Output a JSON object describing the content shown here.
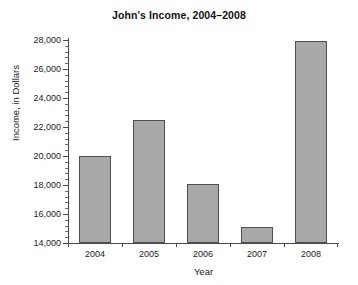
{
  "chart_data": {
    "type": "bar",
    "title": "John's Income, 2004–2008",
    "xlabel": "Year",
    "ylabel": "Income, in Dollars",
    "categories": [
      "2004",
      "2005",
      "2006",
      "2007",
      "2008"
    ],
    "values": [
      20000,
      22500,
      18100,
      15100,
      27950
    ],
    "ylim": [
      14000,
      28000
    ],
    "y_major_ticks": [
      14000,
      16000,
      18000,
      20000,
      22000,
      24000,
      26000,
      28000
    ],
    "y_tick_labels": [
      "14,000",
      "16,000",
      "18,000",
      "20,000",
      "22,000",
      "24,000",
      "26,000",
      "28,000"
    ],
    "y_minor_tick_step": 400,
    "grid": false,
    "legend": "none",
    "bar_color": "#a8a8a8",
    "bar_border_color": "#4f4f4f",
    "axis_color": "#4a4a4a",
    "background_color": "#ffffff"
  }
}
